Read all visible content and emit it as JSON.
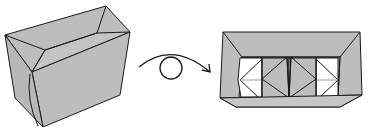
{
  "diagram": {
    "type": "origami-folding-step",
    "steps": [
      {
        "id": "box-3d",
        "label": "Box (3D view)"
      },
      {
        "id": "turn-over",
        "label": "Turn over"
      },
      {
        "id": "box-top-view",
        "label": "Box (top view, interior)"
      }
    ],
    "colors": {
      "paper_gray": "#bdbdbd",
      "paper_white": "#ffffff",
      "stroke": "#1a1a1a",
      "crease": "#9a9a9a"
    }
  }
}
